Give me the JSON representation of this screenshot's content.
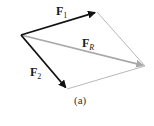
{
  "diagram": {
    "type": "vector-parallelogram",
    "labels": {
      "f1": {
        "main": "F",
        "sub": "1"
      },
      "f2": {
        "main": "F",
        "sub": "2"
      },
      "fr": {
        "main": "F",
        "sub": "R"
      }
    },
    "caption": "(a)",
    "points": {
      "origin": [
        21,
        35
      ],
      "f1_tip": [
        97,
        12
      ],
      "f2_tip": [
        67,
        89
      ],
      "resultant_tip": [
        145,
        66
      ]
    },
    "colors": {
      "force_vectors": "#111111",
      "resultant": "#a8a8a8",
      "construction_lines": "#b0b0b0"
    }
  }
}
